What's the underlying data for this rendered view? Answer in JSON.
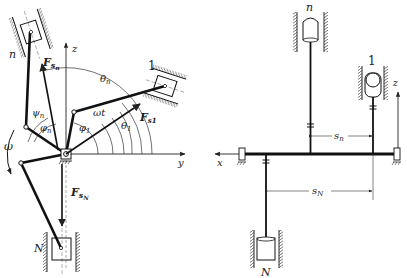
{
  "left_view": {
    "labels": {
      "n": "n",
      "one": "1",
      "N": "N",
      "z": "z",
      "y": "y",
      "omega": "ω",
      "omega_t": "ωt",
      "theta_n": "θ",
      "theta_n_sub": "n",
      "theta_1": "θ",
      "theta_1_sub": "1",
      "phi_n": "φ",
      "phi_n_sub": "n",
      "phi_1": "φ",
      "phi_1_sub": "1",
      "psi_n": "ψ",
      "psi_n_sub": "n",
      "F_sn": "F",
      "F_sn_sub": "s",
      "F_sn_subsub": "n",
      "F_s1": "F",
      "F_s1_sub": "s1",
      "F_sN": "F",
      "F_sN_sub": "s",
      "F_sN_subsub": "N"
    }
  },
  "right_view": {
    "labels": {
      "n": "n",
      "one": "1",
      "N": "N",
      "z": "z",
      "x": "x",
      "s_n": "s",
      "s_n_sub": "n",
      "s_N": "s",
      "s_N_sub": "N"
    }
  },
  "colors": {
    "ink": "#222222",
    "background": "#ffffff"
  }
}
